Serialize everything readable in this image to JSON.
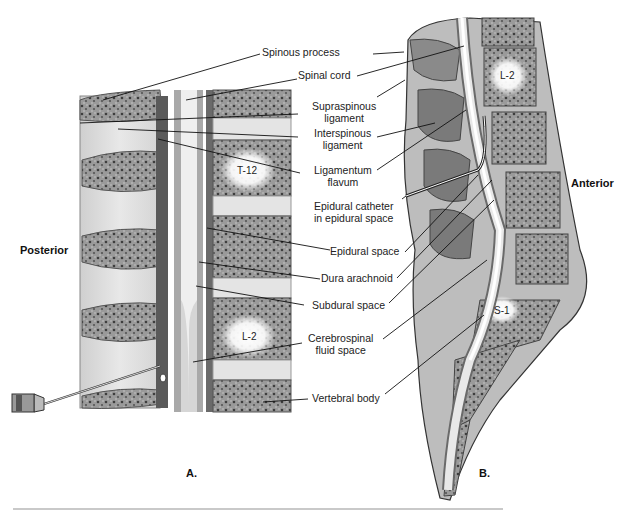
{
  "figure": {
    "panels": [
      {
        "id": "A",
        "label": "A.",
        "view": "posterior longitudinal section"
      },
      {
        "id": "B",
        "label": "B.",
        "view": "sagittal section"
      }
    ],
    "orientation": {
      "left": "Posterior",
      "right": "Anterior"
    },
    "vertebra_labels": {
      "a_top": "T-12",
      "a_bottom": "L-2",
      "b_top": "L-2",
      "b_bottom": "S-1"
    },
    "callouts": [
      {
        "id": "spinous-process",
        "lines": [
          "Spinous process"
        ]
      },
      {
        "id": "spinal-cord",
        "lines": [
          "Spinal cord"
        ]
      },
      {
        "id": "supraspinous-ligament",
        "lines": [
          "Supraspinous",
          "ligament"
        ]
      },
      {
        "id": "interspinous-ligament",
        "lines": [
          "Interspinous",
          "ligament"
        ]
      },
      {
        "id": "ligamentum-flavum",
        "lines": [
          "Ligamentum",
          "flavum"
        ]
      },
      {
        "id": "epidural-catheter",
        "lines": [
          "Epidural catheter",
          "in epidural space"
        ]
      },
      {
        "id": "epidural-space",
        "lines": [
          "Epidural space"
        ]
      },
      {
        "id": "dura-arachnoid",
        "lines": [
          "Dura arachnoid"
        ]
      },
      {
        "id": "subdural-space",
        "lines": [
          "Subdural space"
        ]
      },
      {
        "id": "csf-space",
        "lines": [
          "Cerebrospinal",
          "fluid space"
        ]
      },
      {
        "id": "vertebral-body",
        "lines": [
          "Vertebral body"
        ]
      }
    ],
    "colors": {
      "bone": "#8a8a8a",
      "bone_dark": "#4a4a4a",
      "disc": "#e6e6e6",
      "ligament": "#d9d9d9",
      "dura": "#6e6e6e",
      "csf": "#bdbdbd",
      "cord": "#efefef",
      "rule": "#c9c9c9"
    }
  }
}
